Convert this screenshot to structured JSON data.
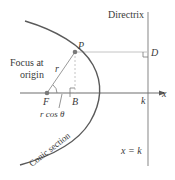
{
  "diagram": {
    "labels": {
      "directrix": "Directrix",
      "point_p": "P",
      "point_d": "D",
      "focus_line1": "Focus at",
      "focus_line2": "origin",
      "radius": "r",
      "point_f": "F",
      "point_b": "B",
      "r_cos_theta": "r cos θ",
      "axis_x": "x",
      "k_tick": "k",
      "conic": "Conic section",
      "directrix_eq": "x = k"
    },
    "colors": {
      "axis": "#6e6e6e",
      "curve": "#5a5a5a",
      "guide": "#b8b8b8",
      "text": "#3a3a3a",
      "point": "#7a7a7a"
    }
  }
}
